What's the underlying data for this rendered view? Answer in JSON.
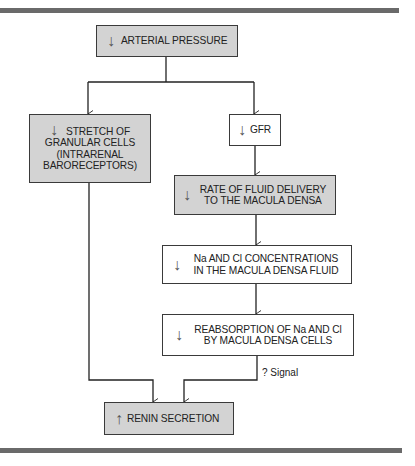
{
  "diagram": {
    "type": "flowchart",
    "colors": {
      "rule_bar": "#6a6a6a",
      "shaded_fill": "#d3d3d3",
      "border": "#3a3a3a",
      "line": "#222222"
    },
    "nodes": {
      "arterial_pressure": {
        "direction": "↓",
        "lines": [
          "ARTERIAL PRESSURE"
        ],
        "shaded": true
      },
      "stretch_granular": {
        "direction": "↓",
        "lines": [
          "STRETCH OF",
          "GRANULAR CELLS",
          "(INTRARENAL",
          "BARORECEPTORS)"
        ],
        "shaded": true
      },
      "gfr": {
        "direction": "↓",
        "lines": [
          "GFR"
        ],
        "shaded": false
      },
      "fluid_delivery": {
        "direction": "↓",
        "lines": [
          "RATE OF FLUID DELIVERY",
          "TO THE MACULA DENSA"
        ],
        "shaded": true
      },
      "nacl_concentration": {
        "direction": "↓",
        "lines": [
          "Na AND Cl CONCENTRATIONS",
          "IN THE MACULA DENSA FLUID"
        ],
        "shaded": false
      },
      "reabsorption": {
        "direction": "↓",
        "lines": [
          "REABSORPTION OF Na AND Cl",
          "BY MACULA DENSA CELLS"
        ],
        "shaded": false
      },
      "renin_secretion": {
        "direction": "↑",
        "lines": [
          "RENIN SECRETION"
        ],
        "shaded": true
      }
    },
    "edges": [
      {
        "from": "arterial_pressure",
        "to": "stretch_granular",
        "label": ""
      },
      {
        "from": "arterial_pressure",
        "to": "gfr",
        "label": ""
      },
      {
        "from": "gfr",
        "to": "fluid_delivery",
        "label": ""
      },
      {
        "from": "fluid_delivery",
        "to": "nacl_concentration",
        "label": ""
      },
      {
        "from": "nacl_concentration",
        "to": "reabsorption",
        "label": ""
      },
      {
        "from": "stretch_granular",
        "to": "renin_secretion",
        "label": ""
      },
      {
        "from": "reabsorption",
        "to": "renin_secretion",
        "label": "? Signal"
      }
    ],
    "signal_label": "? Signal"
  }
}
